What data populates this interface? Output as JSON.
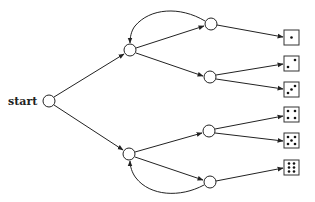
{
  "diagram": {
    "type": "tree",
    "start_label": "start",
    "nodes": [
      {
        "id": "start",
        "x": 49,
        "y": 101,
        "label": "start"
      },
      {
        "id": "H",
        "x": 130,
        "y": 50
      },
      {
        "id": "T",
        "x": 129,
        "y": 154
      },
      {
        "id": "HH",
        "x": 211,
        "y": 24
      },
      {
        "id": "HT",
        "x": 210,
        "y": 77
      },
      {
        "id": "TH",
        "x": 209,
        "y": 131
      },
      {
        "id": "TT",
        "x": 210,
        "y": 182
      }
    ],
    "outcomes": [
      {
        "from": "HH",
        "die": 1,
        "y": 38
      },
      {
        "from": "HT",
        "die": 2,
        "y": 64
      },
      {
        "from": "HT",
        "die": 3,
        "y": 90
      },
      {
        "from": "TH",
        "die": 4,
        "y": 115
      },
      {
        "from": "TH",
        "die": 5,
        "y": 141
      },
      {
        "from": "TT",
        "die": 6,
        "y": 168
      }
    ],
    "loop_edges": [
      {
        "from": "HH",
        "to": "H"
      },
      {
        "from": "TT",
        "to": "T"
      }
    ]
  }
}
